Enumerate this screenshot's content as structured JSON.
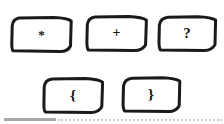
{
  "page": {
    "background_color": "#ffffff",
    "stroke_color": "#1a1a1a",
    "glyph_color": "#111111",
    "width": 224,
    "height": 124
  },
  "keys": {
    "rows": [
      {
        "row_label": "top-row",
        "items": [
          {
            "name": "key-asterisk",
            "glyph": "*",
            "glyph_name": "asterisk-symbol",
            "x": 10,
            "y": 15,
            "w": 63,
            "h": 38
          },
          {
            "name": "key-plus",
            "glyph": "+",
            "glyph_name": "plus-symbol",
            "x": 85,
            "y": 14,
            "w": 63,
            "h": 38
          },
          {
            "name": "key-question",
            "glyph": "?",
            "glyph_name": "question-mark-symbol",
            "x": 157,
            "y": 14,
            "w": 60,
            "h": 38
          }
        ]
      },
      {
        "row_label": "bottom-row",
        "items": [
          {
            "name": "key-left-brace",
            "glyph": "{",
            "glyph_name": "left-curly-brace-symbol",
            "x": 42,
            "y": 76,
            "w": 62,
            "h": 38
          },
          {
            "name": "key-right-brace",
            "glyph": "}",
            "glyph_name": "right-curly-brace-symbol",
            "x": 121,
            "y": 75,
            "w": 60,
            "h": 38
          }
        ]
      }
    ]
  },
  "footer": {
    "solid_rule": {
      "name": "footer-solid-rule",
      "color": "#a8a8a8",
      "x": 4,
      "y": 118,
      "w": 52
    },
    "dotted_rule": {
      "name": "footer-dotted-rule",
      "color": "#c9c9c9",
      "x": 58,
      "y": 119,
      "w": 164
    }
  }
}
